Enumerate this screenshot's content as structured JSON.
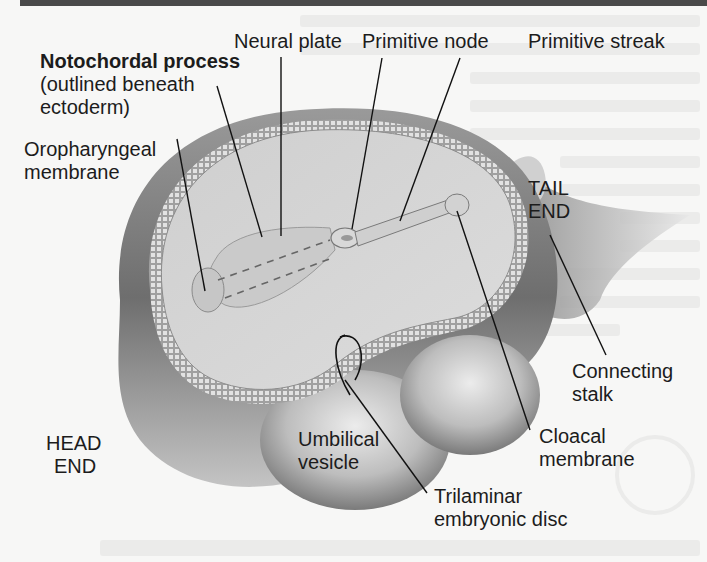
{
  "figure": {
    "labels": {
      "notochordal_process_title": "Notochordal process",
      "notochordal_process_note_1": "(outlined beneath",
      "notochordal_process_note_2": "ectoderm)",
      "neural_plate": "Neural plate",
      "primitive_node": "Primitive node",
      "primitive_streak": "Primitive streak",
      "oropharyngeal_1": "Oropharyngeal",
      "oropharyngeal_2": "membrane",
      "tail_1": "TAIL",
      "tail_2": "END",
      "connecting_stalk_1": "Connecting",
      "connecting_stalk_2": "stalk",
      "cloacal_1": "Cloacal",
      "cloacal_2": "membrane",
      "head_1": "HEAD",
      "head_2": "END",
      "umbilical_1": "Umbilical",
      "umbilical_2": "vesicle",
      "trilaminar_1": "Trilaminar",
      "trilaminar_2": "embryonic disc"
    },
    "colors": {
      "background": "#f7f7f6",
      "label_text": "#1c1c1c",
      "leader_line": "#111111",
      "tissue_light": "#d6d6d6",
      "tissue_mid": "#a8a8a8",
      "tissue_dark": "#5a5a5a"
    }
  }
}
